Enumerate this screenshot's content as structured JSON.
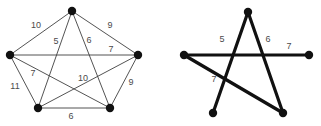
{
  "figure": {
    "canvas": {
      "width": 321,
      "height": 126,
      "background": "#ffffff"
    },
    "style": {
      "vertex_color": "#111111",
      "thin_edge_color": "#3f3f3f",
      "thick_edge_color": "#111111",
      "label_color": "#4a4a4a",
      "vertex_radius": 4.2,
      "thin_edge_width": 0.9,
      "thick_edge_width": 3.2
    },
    "panels": [
      {
        "name": "complete-graph-panel",
        "vertices": [
          {
            "id": "A",
            "x": 72,
            "y": 11
          },
          {
            "id": "B",
            "x": 138,
            "y": 55
          },
          {
            "id": "C",
            "x": 110,
            "y": 108
          },
          {
            "id": "D",
            "x": 38,
            "y": 108
          },
          {
            "id": "E",
            "x": 10,
            "y": 55
          }
        ],
        "edges": [
          {
            "from": "A",
            "to": "E",
            "weight": "10",
            "label_x": 36,
            "label_y": 26,
            "emphasis": "thin"
          },
          {
            "from": "A",
            "to": "B",
            "weight": "9",
            "label_x": 110,
            "label_y": 26,
            "emphasis": "thin"
          },
          {
            "from": "A",
            "to": "D",
            "weight": "5",
            "label_x": 56,
            "label_y": 42,
            "emphasis": "thin"
          },
          {
            "from": "A",
            "to": "C",
            "weight": "6",
            "label_x": 89,
            "label_y": 41,
            "emphasis": "thin"
          },
          {
            "from": "E",
            "to": "B",
            "weight": "7",
            "label_x": 111,
            "label_y": 50,
            "emphasis": "thin"
          },
          {
            "from": "E",
            "to": "D",
            "weight": "11",
            "label_x": 15,
            "label_y": 87,
            "emphasis": "thin"
          },
          {
            "from": "E",
            "to": "C",
            "weight": "7",
            "label_x": 33,
            "label_y": 74,
            "emphasis": "thin"
          },
          {
            "from": "B",
            "to": "D",
            "weight": "10",
            "label_x": 83,
            "label_y": 79,
            "emphasis": "thin"
          },
          {
            "from": "B",
            "to": "C",
            "weight": "9",
            "label_x": 131,
            "label_y": 83,
            "emphasis": "thin"
          },
          {
            "from": "D",
            "to": "C",
            "weight": "6",
            "label_x": 71,
            "label_y": 117,
            "emphasis": "thin"
          }
        ]
      },
      {
        "name": "star-subgraph-panel",
        "vertices": [
          {
            "id": "A2",
            "x": 248,
            "y": 12
          },
          {
            "id": "B2",
            "x": 309,
            "y": 55
          },
          {
            "id": "C2",
            "x": 283,
            "y": 113
          },
          {
            "id": "D2",
            "x": 213,
            "y": 113
          },
          {
            "id": "E2",
            "x": 184,
            "y": 55
          }
        ],
        "edges": [
          {
            "from": "A2",
            "to": "D2",
            "weight": "5",
            "label_x": 222,
            "label_y": 40,
            "emphasis": "thick"
          },
          {
            "from": "A2",
            "to": "C2",
            "weight": "6",
            "label_x": 268,
            "label_y": 40,
            "emphasis": "thick"
          },
          {
            "from": "E2",
            "to": "B2",
            "weight": "7",
            "label_x": 289,
            "label_y": 47,
            "emphasis": "thick"
          },
          {
            "from": "E2",
            "to": "C2",
            "weight": "7",
            "label_x": 214,
            "label_y": 80,
            "emphasis": "thick"
          }
        ]
      }
    ]
  }
}
